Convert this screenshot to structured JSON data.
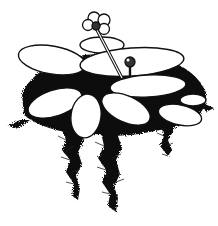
{
  "image": {
    "subject": "Pen-and-ink botanical illustration of a floating aquatic plant",
    "description": "Oval floating leaves radiating over a dark, feathery mass of submerged roots/fronds, with a four-lobed flower on a tall stalk and a smaller stalked bud",
    "colors": {
      "ink": "#111111",
      "paper": "#ffffff",
      "caption": "#cfcfcf"
    }
  },
  "caption": {
    "text": ""
  }
}
